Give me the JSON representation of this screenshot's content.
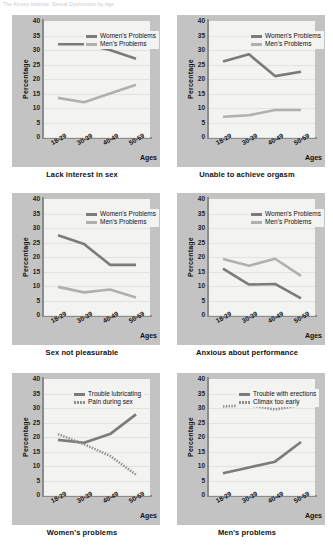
{
  "header": {
    "ghost_text": "The Kinsey Institute: Sexual Dysfunction by Age"
  },
  "axis": {
    "ylabel": "Percentage",
    "xlabel": "Ages",
    "yticks": [
      "40",
      "35",
      "30",
      "25",
      "20",
      "15",
      "10",
      "5",
      "0"
    ],
    "categories": [
      "18-29",
      "30-39",
      "40-49",
      "50-59"
    ],
    "ymin": 0,
    "ymax": 40
  },
  "colors": {
    "women_line": "#7b7b7b",
    "men_line": "#b0b0b0",
    "solid_line": "#7b7b7b",
    "dotted_line": "#8d8d8d",
    "panel_bg": "#c3c3c3",
    "plot_bg": "#f3f3f1",
    "axis": "#8b8b8b",
    "gridline": "#e2e2df"
  },
  "chart_data": [
    {
      "type": "line",
      "title": "Lack interest in sex",
      "xlabel": "Ages",
      "ylabel": "Percentage",
      "ylim": [
        0,
        40
      ],
      "grid": true,
      "legend_position": "top-right",
      "categories": [
        "18-29",
        "30-39",
        "40-49",
        "50-59"
      ],
      "series": [
        {
          "name": "Women's Problems",
          "values": [
            32,
            32,
            30,
            27
          ]
        },
        {
          "name": "Men's Problems",
          "values": [
            13.5,
            12,
            15,
            18
          ]
        }
      ]
    },
    {
      "type": "line",
      "title": "Unable to achieve orgasm",
      "xlabel": "Ages",
      "ylabel": "Percentage",
      "ylim": [
        0,
        40
      ],
      "grid": true,
      "legend_position": "top-right",
      "categories": [
        "18-29",
        "30-39",
        "40-49",
        "50-59"
      ],
      "series": [
        {
          "name": "Women's Problems",
          "values": [
            26,
            28.5,
            21,
            22.5
          ]
        },
        {
          "name": "Men's Problems",
          "values": [
            7,
            7.5,
            9.3,
            9.3
          ]
        }
      ]
    },
    {
      "type": "line",
      "title": "Sex not pleasurable",
      "xlabel": "Ages",
      "ylabel": "Percentage",
      "ylim": [
        0,
        40
      ],
      "grid": true,
      "legend_position": "top-right",
      "categories": [
        "18-29",
        "30-39",
        "40-49",
        "50-59"
      ],
      "series": [
        {
          "name": "Women's Problems",
          "values": [
            27.5,
            24.5,
            17.3,
            17.3
          ]
        },
        {
          "name": "Men's Problems",
          "values": [
            9.7,
            7.8,
            8.8,
            6
          ]
        }
      ]
    },
    {
      "type": "line",
      "title": "Anxious about performance",
      "xlabel": "Ages",
      "ylabel": "Percentage",
      "ylim": [
        0,
        40
      ],
      "grid": true,
      "legend_position": "top-right",
      "categories": [
        "18-29",
        "30-39",
        "40-49",
        "50-59"
      ],
      "series": [
        {
          "name": "Women's Problems",
          "values": [
            16,
            10.5,
            10.7,
            5.7
          ]
        },
        {
          "name": "Men's Problems",
          "values": [
            19.3,
            17,
            19.4,
            13.5
          ]
        }
      ]
    },
    {
      "type": "line",
      "title": "Women's problems",
      "xlabel": "Ages",
      "ylabel": "Percentage",
      "ylim": [
        0,
        40
      ],
      "grid": true,
      "legend_position": "top-right",
      "categories": [
        "18-29",
        "30-39",
        "40-49",
        "50-59"
      ],
      "series": [
        {
          "name": "Trouble lubricating",
          "values": [
            19,
            18,
            21,
            27.8
          ],
          "style": "solid"
        },
        {
          "name": "Pain during sex",
          "values": [
            21,
            17.5,
            13.5,
            7
          ],
          "style": "dotted"
        }
      ]
    },
    {
      "type": "line",
      "title": "Men's problems",
      "xlabel": "Ages",
      "ylabel": "Percentage",
      "ylim": [
        0,
        40
      ],
      "grid": true,
      "legend_position": "top-right",
      "categories": [
        "18-29",
        "30-39",
        "40-49",
        "50-59"
      ],
      "series": [
        {
          "name": "Trouble with erections",
          "values": [
            7.5,
            9.5,
            11.5,
            18.3
          ],
          "style": "solid"
        },
        {
          "name": "Climax too early",
          "values": [
            30.5,
            31,
            29.5,
            31
          ],
          "style": "dotted"
        }
      ]
    }
  ]
}
